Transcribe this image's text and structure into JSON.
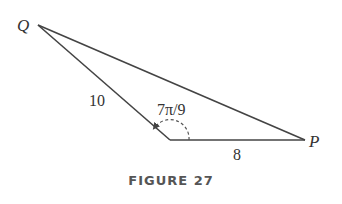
{
  "figure": {
    "caption": "FIGURE 27",
    "vertices": {
      "Q": {
        "label": "Q",
        "x": 38,
        "y": 25
      },
      "R": {
        "label": "",
        "x": 170,
        "y": 140
      },
      "P": {
        "label": "P",
        "x": 305,
        "y": 140
      }
    },
    "sides": {
      "QR": {
        "label": "10"
      },
      "RP": {
        "label": "8"
      }
    },
    "angle": {
      "label": "7π/9",
      "at_vertex": "R"
    },
    "colors": {
      "stroke": "#444444",
      "text": "#333333",
      "caption": "#555555"
    }
  }
}
